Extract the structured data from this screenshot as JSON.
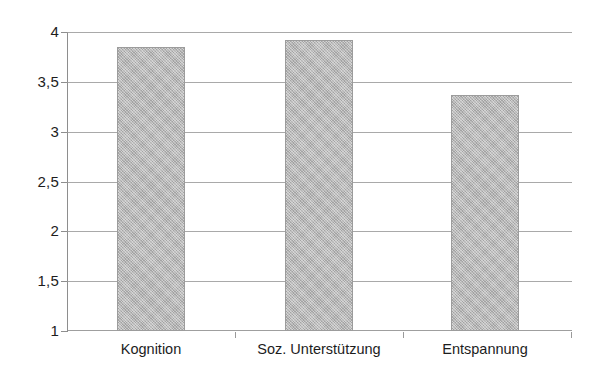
{
  "chart_data": {
    "type": "bar",
    "title": "",
    "subtitle": "",
    "xlabel": "",
    "ylabel": "",
    "categories": [
      "Kognition",
      "Soz. Unterstützung",
      "Entspannung"
    ],
    "values": [
      3.85,
      3.92,
      3.37
    ],
    "series": [
      {
        "name": "",
        "values": [
          3.85,
          3.92,
          3.37
        ]
      }
    ],
    "ylim": [
      1,
      4
    ],
    "yticks": [
      1,
      1.5,
      2,
      2.5,
      3,
      3.5,
      4
    ],
    "ytick_labels": [
      "1",
      "1,5",
      "2",
      "2,5",
      "3",
      "3,5",
      "4"
    ],
    "grid": true,
    "grid_axis": "y",
    "legend": false,
    "legend_position": "none",
    "annotations": [],
    "bar_color": "#b3b3b3",
    "bar_edge_color": "#9c9c9c",
    "gridline_color": "#9a9a9a",
    "axis_color": "#8e8e8e",
    "background_color": "#ffffff",
    "text_color": "#1d1d1d",
    "decimal_separator": ","
  }
}
